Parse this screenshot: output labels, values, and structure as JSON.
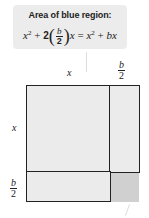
{
  "callout": {
    "title": "Area of blue region:",
    "equation": {
      "x": "x",
      "sq": "2",
      "plus": "+",
      "coef": "2",
      "frac_num": "b",
      "frac_den": "2",
      "equals": "=",
      "rhs_b": "b"
    }
  },
  "labels": {
    "top_x": "x",
    "top_frac_num": "b",
    "top_frac_den": "2",
    "left_x": "x",
    "left_frac_num": "b",
    "left_frac_den": "2"
  },
  "colors": {
    "region_fill": "#ebebeb",
    "missing_corner": "#d0d0d0",
    "outline": "#222222",
    "callout_bg": "#ececec"
  }
}
